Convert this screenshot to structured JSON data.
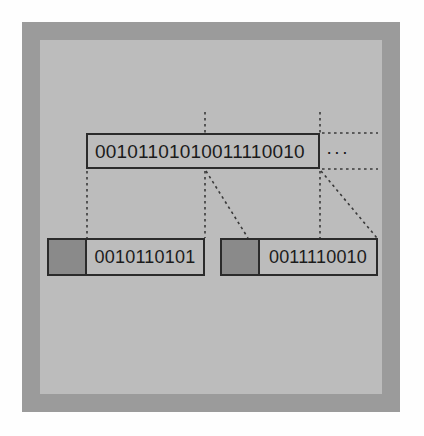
{
  "figure": {
    "colors": {
      "page_background": "#ffffff",
      "frame": "#9b9b9b",
      "canvas": "#bcbcbc",
      "box_border": "#2b2b2b",
      "header_cell_fill": "#8a8a8a",
      "text": "#1b1b1b",
      "connector": "#3a3a3a"
    }
  },
  "stream": {
    "name": "bit-stream",
    "first_segment": "0010110101",
    "second_segment": "0011110010",
    "full_text": "00101101010011110010",
    "continuation": "···"
  },
  "packets": [
    {
      "id": "packet-left",
      "header_label": "",
      "payload": "0010110101"
    },
    {
      "id": "packet-right",
      "header_label": "",
      "payload": "0011110010"
    }
  ],
  "connectors": {
    "left_vertical": "stream-left-edge-to-packet-left",
    "middle_vertical": "stream-split-point",
    "right_vertical": "stream-right-edge",
    "diagonal_left": "split-to-packet-left-end",
    "diagonal_right": "stream-end-to-packet-right-end",
    "horizontal_top": "stream-continues-top",
    "horizontal_bottom": "stream-continues-bottom"
  }
}
